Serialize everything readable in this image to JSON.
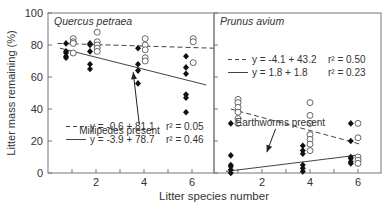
{
  "chart_data": {
    "type": "scatter",
    "ylabel": "Litter mass remaining (%)",
    "xlabel": "Litter species number",
    "ylim": [
      0,
      100
    ],
    "yticks": [
      0,
      20,
      40,
      60,
      80,
      100
    ],
    "xticks": [
      2,
      4,
      6
    ],
    "grid": false,
    "panels": [
      {
        "title": "Quercus petraea",
        "xlim": [
          0,
          6.9
        ],
        "annotation": {
          "text": "Millipedes present",
          "x": 1.3,
          "y": 27,
          "arrow_to": [
            3.55,
            63
          ]
        },
        "legend": [
          {
            "style": "dashed",
            "text": "y = -0.6 + 81.1",
            "r2": "r² = 0.05"
          },
          {
            "style": "solid",
            "text": "y = -3.9 + 78.7",
            "r2": "r² = 0.46"
          }
        ],
        "series": [
          {
            "name": "without fauna (open)",
            "marker": "open-circle",
            "points": [
              [
                1.05,
                84
              ],
              [
                1.05,
                82
              ],
              [
                1.05,
                81
              ],
              [
                1.05,
                75
              ],
              [
                2.05,
                88
              ],
              [
                2.05,
                82
              ],
              [
                2.05,
                80
              ],
              [
                2.05,
                78
              ],
              [
                2.05,
                76
              ],
              [
                4.05,
                84
              ],
              [
                4.05,
                80
              ],
              [
                4.05,
                77
              ],
              [
                4.05,
                72
              ],
              [
                4.05,
                70
              ],
              [
                6.05,
                84
              ],
              [
                6.05,
                82
              ],
              [
                6.05,
                69
              ]
            ]
          },
          {
            "name": "with millipedes (filled)",
            "marker": "filled-diamond",
            "points": [
              [
                0.75,
                81
              ],
              [
                0.75,
                76
              ],
              [
                0.75,
                75
              ],
              [
                0.75,
                73
              ],
              [
                0.75,
                72
              ],
              [
                1.75,
                81
              ],
              [
                1.75,
                80
              ],
              [
                1.75,
                76
              ],
              [
                1.75,
                68
              ],
              [
                1.75,
                65
              ],
              [
                3.75,
                78
              ],
              [
                3.75,
                68
              ],
              [
                3.75,
                64
              ],
              [
                3.75,
                56
              ],
              [
                5.75,
                73
              ],
              [
                5.75,
                66
              ],
              [
                5.75,
                62
              ],
              [
                5.75,
                49
              ],
              [
                5.75,
                47
              ],
              [
                5.75,
                38
              ]
            ]
          }
        ],
        "lines": [
          {
            "style": "dashed",
            "x": [
              0.4,
              6.9
            ],
            "y": [
              81,
              78
            ]
          },
          {
            "style": "solid",
            "x": [
              0.5,
              6.6
            ],
            "y": [
              78,
              55
            ]
          }
        ]
      },
      {
        "title": "Prunus avium",
        "xlim": [
          0,
          7
        ],
        "annotation": {
          "text": "Earthworms present",
          "x": 0.9,
          "y": 32,
          "arrow_to": [
            2.2,
            13
          ]
        },
        "legend": [
          {
            "style": "dashed",
            "text": "y = -4.1 + 43.2",
            "r2": "r² = 0.50"
          },
          {
            "style": "solid",
            "text": "y =  1.8 +   1.8",
            "r2": "r² = 0.23"
          }
        ],
        "series": [
          {
            "name": "without fauna (open)",
            "marker": "open-circle",
            "points": [
              [
                1.0,
                46
              ],
              [
                1.0,
                44
              ],
              [
                1.0,
                41
              ],
              [
                1.0,
                38
              ],
              [
                1.0,
                34
              ],
              [
                1.0,
                31
              ],
              [
                4.0,
                44
              ],
              [
                4.0,
                36
              ],
              [
                4.0,
                31
              ],
              [
                4.0,
                24
              ],
              [
                4.0,
                21
              ],
              [
                4.0,
                18
              ],
              [
                4.0,
                14
              ],
              [
                6.0,
                31
              ],
              [
                6.0,
                22
              ],
              [
                6.0,
                10
              ],
              [
                6.0,
                8
              ],
              [
                6.0,
                6
              ]
            ]
          },
          {
            "name": "with earthworms (filled)",
            "marker": "filled-diamond",
            "points": [
              [
                0.7,
                31
              ],
              [
                0.7,
                11
              ],
              [
                0.7,
                5
              ],
              [
                0.7,
                4
              ],
              [
                0.7,
                2
              ],
              [
                0.7,
                0
              ],
              [
                3.7,
                17
              ],
              [
                3.7,
                14
              ],
              [
                3.7,
                12
              ],
              [
                3.7,
                5
              ],
              [
                3.7,
                3
              ],
              [
                3.7,
                1
              ],
              [
                5.7,
                31
              ],
              [
                5.7,
                20
              ],
              [
                5.7,
                10
              ],
              [
                5.7,
                9
              ],
              [
                5.7,
                7
              ],
              [
                5.7,
                6
              ]
            ]
          }
        ],
        "lines": [
          {
            "style": "dashed",
            "x": [
              0.7,
              6.1
            ],
            "y": [
              40,
              18
            ]
          },
          {
            "style": "solid",
            "x": [
              0.5,
              5.9
            ],
            "y": [
              1,
              11
            ]
          }
        ]
      }
    ]
  },
  "labels": {
    "ylabel": "Litter mass remaining (%)",
    "xlabel": "Litter species number",
    "panel1_title": "Quercus petraea",
    "panel2_title": "Prunus avium"
  }
}
